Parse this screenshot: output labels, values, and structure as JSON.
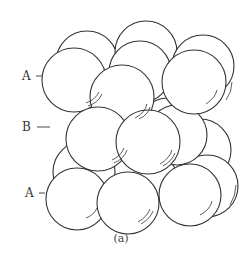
{
  "figure": {
    "caption": "(a)",
    "stroke_color": "#333333",
    "fill_color": "#ffffff",
    "labels": [
      {
        "text": "A",
        "layer": "top"
      },
      {
        "text": "B",
        "layer": "middle"
      },
      {
        "text": "A",
        "layer": "bottom"
      }
    ],
    "layers": [
      {
        "name": "A",
        "position": "top"
      },
      {
        "name": "B",
        "position": "middle"
      },
      {
        "name": "A",
        "position": "bottom"
      }
    ]
  }
}
